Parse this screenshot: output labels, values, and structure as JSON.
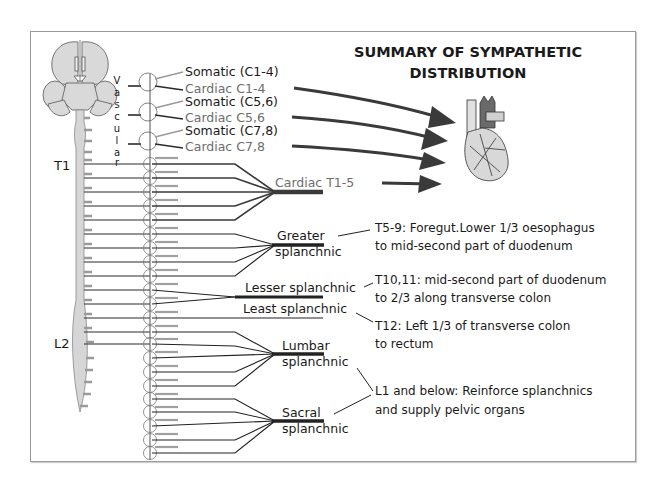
{
  "title": {
    "line1": "SUMMARY OF SYMPATHETIC",
    "line2": "DISTRIBUTION"
  },
  "spinal_labels": {
    "t1": "T1",
    "l2": "L2"
  },
  "vascular_letters": [
    "V",
    "a",
    "s",
    "c",
    "u",
    "l",
    "a",
    "r"
  ],
  "cervical_ganglia": [
    {
      "somatic": "Somatic (C1-4)",
      "cardiac": "Cardiac C1-4"
    },
    {
      "somatic": "Somatic (C5,6)",
      "cardiac": "Cardiac C5,6"
    },
    {
      "somatic": "Somatic (C7,8)",
      "cardiac": "Cardiac C7,8"
    }
  ],
  "nerves": {
    "cardiac_t": "Cardiac T1-5",
    "greater_1": "Greater",
    "greater_2": "splanchnic",
    "lesser": "Lesser splanchnic",
    "least": "Least splanchnic",
    "lumbar_1": "Lumbar",
    "lumbar_2": "splanchnic",
    "sacral_1": "Sacral",
    "sacral_2": "splanchnic"
  },
  "descriptions": {
    "greater_1": "T5-9: Foregut.Lower 1/3 oesophagus",
    "greater_2": "to mid-second part of duodenum",
    "lesser_1": "T10,11: mid-second part of duodenum",
    "lesser_2": "to 2/3 along transverse colon",
    "least_1": "T12: Left 1/3 of transverse colon",
    "least_2": "to rectum",
    "pelvic_1": "L1 and below: Reinforce splanchnics",
    "pelvic_2": "and supply pelvic organs"
  },
  "icons": {
    "brain": "brain-icon",
    "heart": "heart-icon",
    "arrow": "arrow-icon"
  },
  "colors": {
    "line": "#2a2a2a",
    "grey_line": "#9a9a9a",
    "organ_fill": "#d4d4d4",
    "arrow": "#3a3a3a",
    "heart_vessel": "#6a6a6a"
  }
}
